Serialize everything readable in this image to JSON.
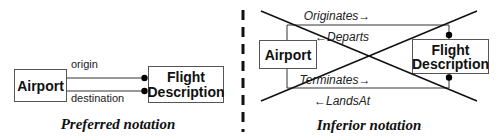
{
  "left_panel": {
    "entity_a": {
      "label": "Airport"
    },
    "entity_b": {
      "line1": "Flight",
      "line2": "Description"
    },
    "relationships": [
      {
        "label": "origin"
      },
      {
        "label": "destination"
      }
    ],
    "caption": "Preferred notation"
  },
  "right_panel": {
    "entity_a": {
      "label": "Airport"
    },
    "entity_b": {
      "line1": "Flight",
      "line2": "Description"
    },
    "relationship_labels": {
      "top_forward": "Originates→",
      "top_reverse": "←Departs",
      "bottom_forward": "Terminates→",
      "bottom_reverse": "←LandsAt"
    },
    "crossed_out": true,
    "caption": "Inferior notation"
  },
  "divider": {
    "style": "dashed"
  }
}
